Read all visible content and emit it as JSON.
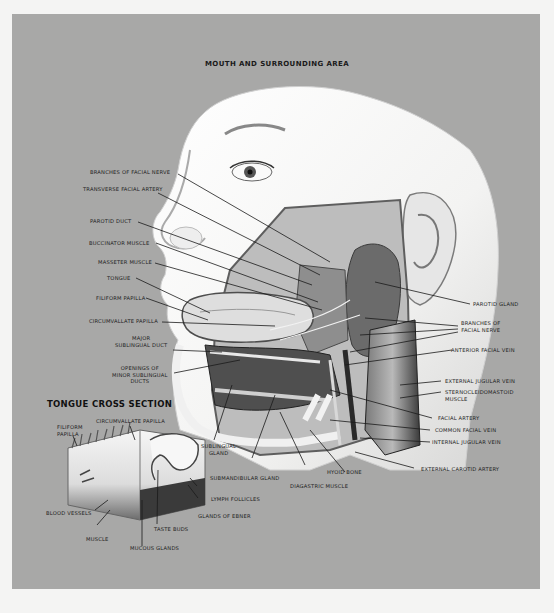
{
  "title": "MOUTH AND SURROUNDING AREA",
  "inset_title": "TONGUE CROSS SECTION",
  "colors": {
    "background": "#a8a8a7",
    "page": "#f4f4f3",
    "text": "#1c1c1c"
  },
  "labels_left": [
    {
      "id": "branches-of-facial-nerve",
      "text": "BRANCHES OF FACIAL NERVE"
    },
    {
      "id": "transverse-facial-artery",
      "text": "TRANSVERSE FACIAL ARTERY"
    },
    {
      "id": "parotid-duct",
      "text": "PAROTID DUCT"
    },
    {
      "id": "buccinator-muscle",
      "text": "BUCCINATOR MUSCLE"
    },
    {
      "id": "masseter-muscle",
      "text": "MASSETER MUSCLE"
    },
    {
      "id": "tongue",
      "text": "TONGUE"
    },
    {
      "id": "filiform-papilla",
      "text": "FILIFORM PAPILLA"
    },
    {
      "id": "circumvallate-papilla",
      "text": "CIRCUMVALLATE PAPILLA"
    },
    {
      "id": "major-sublingual-duct",
      "text": "MAJOR\nSUBLINGUAL DUCT"
    },
    {
      "id": "openings-minor-sublingual-ducts",
      "text": "OPENINGS OF\nMINOR SUBLINGUAL\nDUCTS"
    }
  ],
  "labels_right": [
    {
      "id": "parotid-gland",
      "text": "PAROTID GLAND"
    },
    {
      "id": "branches-of-facial-nerve-r",
      "text": "BRANCHES OF\nFACIAL NERVE"
    },
    {
      "id": "anterior-facial-vein",
      "text": "ANTERIOR FACIAL VEIN"
    },
    {
      "id": "external-jugular-vein",
      "text": "EXTERNAL JUGULAR VEIN"
    },
    {
      "id": "sternocleidomastoid-muscle",
      "text": "STERNOCLEIDOMASTOID\nMUSCLE"
    },
    {
      "id": "facial-artery",
      "text": "FACIAL ARTERY"
    },
    {
      "id": "common-facial-vein",
      "text": "COMMON FACIAL VEIN"
    },
    {
      "id": "internal-jugular-vein",
      "text": "INTERNAL JUGULAR VEIN"
    },
    {
      "id": "external-carotid-artery",
      "text": "EXTERNAL CAROTID ARTERY"
    }
  ],
  "labels_bottom": [
    {
      "id": "sublingual-gland",
      "text": "SUBLINGUAL\nGLAND"
    },
    {
      "id": "submandibular-gland",
      "text": "SUBMANDIBULAR GLAND"
    },
    {
      "id": "hyoid-bone",
      "text": "HYOID BONE"
    },
    {
      "id": "diagastric-muscle",
      "text": "DIAGASTRIC MUSCLE"
    }
  ],
  "labels_inset": [
    {
      "id": "filiform-papilla-inset",
      "text": "FILIFORM\nPAPILLA"
    },
    {
      "id": "circumvallate-papilla-inset",
      "text": "CIRCUMVALLATE PAPILLA"
    },
    {
      "id": "lymph-follicles",
      "text": "LYMPH FOLLICLES"
    },
    {
      "id": "glands-of-ebner",
      "text": "GLANDS OF EBNER"
    },
    {
      "id": "blood-vessels",
      "text": "BLOOD VESSELS"
    },
    {
      "id": "taste-buds",
      "text": "TASTE BUDS"
    },
    {
      "id": "muscle",
      "text": "MUSCLE"
    },
    {
      "id": "mucous-glands",
      "text": "MUCOUS GLANDS"
    }
  ]
}
